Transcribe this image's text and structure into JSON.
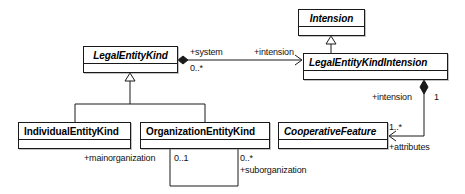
{
  "diagram": {
    "kind": "uml-class-diagram",
    "background_color": "#ffffff",
    "line_color": "#1a1a1a",
    "text_color": "#000000",
    "classes": [
      {
        "id": "intension",
        "name": "Intension",
        "abstract": true,
        "x": 298,
        "y": 9,
        "width": 67,
        "height": 27
      },
      {
        "id": "legal-entity-kind",
        "name": "LegalEntityKind",
        "abstract": true,
        "x": 83,
        "y": 46,
        "width": 95,
        "height": 27
      },
      {
        "id": "legal-entity-kind-intension",
        "name": "LegalEntityKindIntension",
        "abstract": true,
        "x": 303,
        "y": 53,
        "width": 145,
        "height": 27
      },
      {
        "id": "individual-entity-kind",
        "name": "IndividualEntityKind",
        "abstract": false,
        "x": 18,
        "y": 122,
        "width": 113,
        "height": 27
      },
      {
        "id": "organization-entity-kind",
        "name": "OrganizationEntityKind",
        "abstract": false,
        "x": 140,
        "y": 122,
        "width": 130,
        "height": 27
      },
      {
        "id": "cooperative-feature",
        "name": "CooperativeFeature",
        "abstract": true,
        "x": 278,
        "y": 122,
        "width": 110,
        "height": 27
      }
    ],
    "labels": [
      {
        "id": "system-role",
        "text": "+system",
        "x": 190,
        "y": 47
      },
      {
        "id": "system-multiplicity",
        "text": "0..*",
        "x": 190,
        "y": 63
      },
      {
        "id": "intension-role-top",
        "text": "+intension",
        "x": 254,
        "y": 47
      },
      {
        "id": "intension-role-right",
        "text": "+intension",
        "x": 372,
        "y": 92
      },
      {
        "id": "intension-multiplicity",
        "text": "1",
        "x": 434,
        "y": 92
      },
      {
        "id": "attributes-role",
        "text": "+attributes",
        "x": 389,
        "y": 142
      },
      {
        "id": "attributes-multiplicity",
        "text": "1..*",
        "x": 389,
        "y": 123
      },
      {
        "id": "mainorganization-role",
        "text": "+mainorganization",
        "x": 84,
        "y": 153
      },
      {
        "id": "mainorg-multiplicity",
        "text": "0..1",
        "x": 174,
        "y": 153
      },
      {
        "id": "suborg-multiplicity",
        "text": "0..*",
        "x": 240,
        "y": 153
      },
      {
        "id": "suborganization-role",
        "text": "+suborganization",
        "x": 240,
        "y": 165
      }
    ]
  }
}
